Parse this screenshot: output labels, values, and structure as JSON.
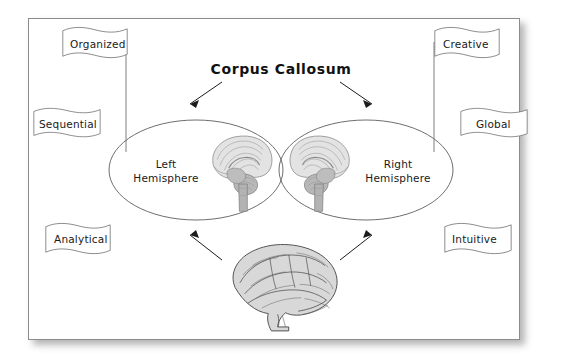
{
  "poster": {
    "title": "Corpus Callosum",
    "background_color": "#ffffff",
    "frame_border_color": "#8c8c8c",
    "ink_color": "#1a1a1a"
  },
  "hemispheres": {
    "left": {
      "line1": "Left",
      "line2": "Hemisphere",
      "illustration": "brain-sagittal-section-icon"
    },
    "right": {
      "line1": "Right",
      "line2": "Hemisphere",
      "illustration": "brain-sagittal-section-icon"
    }
  },
  "banners": {
    "left": [
      {
        "label": "Organized"
      },
      {
        "label": "Sequential"
      },
      {
        "label": "Analytical"
      }
    ],
    "right": [
      {
        "label": "Creative"
      },
      {
        "label": "Global"
      },
      {
        "label": "Intuitive"
      }
    ]
  },
  "illustrations": {
    "bottom_brain": "brain-lateral-view-icon"
  },
  "arrows": {
    "title_to_left": "arrow-down-left-icon",
    "title_to_right": "arrow-down-right-icon",
    "brain_to_left": "arrow-up-left-icon",
    "brain_to_right": "arrow-up-right-icon"
  }
}
